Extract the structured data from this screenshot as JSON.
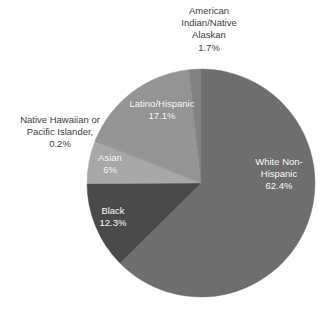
{
  "chart_data": {
    "type": "pie",
    "title": "",
    "subtitle": "",
    "xlabel": "",
    "ylabel": "",
    "legend_position": "none",
    "grid": false,
    "label_format": "name above percentage",
    "start_angle_deg": 0,
    "direction": "clockwise",
    "categories": [
      "White Non-Hispanic",
      "Black",
      "Asian",
      "Native Hawaiian or Pacific Islander",
      "Latino/Hispanic",
      "American Indian/Native Alaskan"
    ],
    "values": [
      62.4,
      12.3,
      6.0,
      0.2,
      17.1,
      1.7
    ],
    "value_labels": [
      "62.4%",
      "12.3%",
      "6%",
      "0.2%",
      "17.1%",
      "1.7%"
    ],
    "slices": [
      {
        "name": "White Non-Hispanic",
        "value": 62.4,
        "value_label": "62.4%",
        "label_line1": "White Non-",
        "label_line2": "Hispanic",
        "color": "#6e6e6e",
        "label_placement": "inside",
        "label_color": "#ffffff"
      },
      {
        "name": "Black",
        "value": 12.3,
        "value_label": "12.3%",
        "label_line1": "Black",
        "label_line2": "",
        "color": "#4a4a4a",
        "label_placement": "inside",
        "label_color": "#ffffff"
      },
      {
        "name": "Asian",
        "value": 6.0,
        "value_label": "6%",
        "label_line1": "Asian",
        "label_line2": "",
        "color": "#a8a8a8",
        "label_placement": "inside",
        "label_color": "#ffffff"
      },
      {
        "name": "Native Hawaiian or Pacific Islander",
        "value": 0.2,
        "value_label": "0.2%",
        "label_line1": "Native Hawaiian or",
        "label_line2": "Pacific Islander,",
        "color": "#8f8f8f",
        "label_placement": "outside",
        "label_color": "#3c3c3c"
      },
      {
        "name": "Latino/Hispanic",
        "value": 17.1,
        "value_label": "17.1%",
        "label_line1": "Latino/Hispanic",
        "label_line2": "",
        "color": "#949494",
        "label_placement": "inside",
        "label_color": "#ffffff"
      },
      {
        "name": "American Indian/Native Alaskan",
        "value": 1.7,
        "value_label": "1.7%",
        "label_line1": "American",
        "label_line2": "Indian/Native",
        "label_line3": "Alaskan",
        "color": "#828282",
        "label_placement": "outside",
        "label_color": "#3c3c3c"
      }
    ]
  },
  "labels": {
    "american_indian": "American\nIndian/Native\nAlaskan\n1.7%",
    "native_hawaiian": "Native Hawaiian or\nPacific Islander,\n0.2%",
    "white_non_hispanic": "White Non-\nHispanic\n62.4%",
    "latino_hispanic": "Latino/Hispanic\n17.1%",
    "asian": "Asian\n6%",
    "black": "Black\n12.3%"
  },
  "geometry": {
    "center_x": 201,
    "center_y": 183,
    "radius": 114
  },
  "colors": {
    "background": "#ffffff",
    "outer_label_text": "#3c3c3c",
    "inner_label_text": "#ffffff"
  }
}
